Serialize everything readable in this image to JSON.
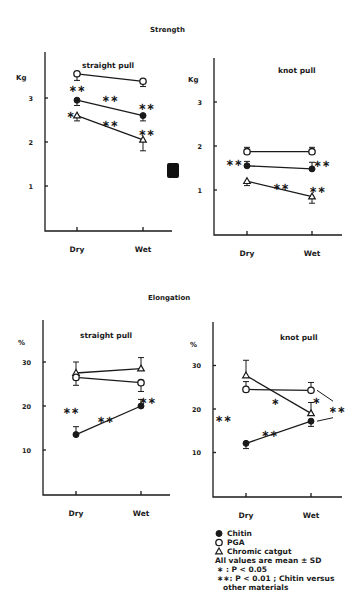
{
  "figure": {
    "section_titles": {
      "strength": "Strength",
      "elongation": "Elongation"
    },
    "legend": {
      "items": [
        {
          "marker": "filled-circle",
          "label": "Chitin"
        },
        {
          "marker": "open-circle",
          "label": "PGA"
        },
        {
          "marker": "open-triangle",
          "label": "Chromic catgut"
        }
      ],
      "notes": [
        "All values are mean ± SD",
        "∗ : P < 0.05",
        "∗∗: P < 0.01 ; Chitin versus",
        "other materials"
      ]
    },
    "artifact": {
      "type": "black-square",
      "color": "#111111"
    }
  },
  "chart_data": [
    {
      "type": "line",
      "title": "straight pull",
      "section": "Strength",
      "xlabel": "",
      "ylabel": "Kg",
      "categories": [
        "Dry",
        "Wet"
      ],
      "yticks": [
        "1",
        "2",
        "3"
      ],
      "ylim": [
        0,
        4
      ],
      "grid": false,
      "series": [
        {
          "name": "PGA",
          "marker": "open-circle",
          "values": [
            3.55,
            3.38
          ],
          "sd": [
            0.15,
            0.12
          ],
          "sd_dir": [
            -1,
            -1
          ]
        },
        {
          "name": "Chitin",
          "marker": "filled-circle",
          "values": [
            2.95,
            2.6
          ],
          "sd": [
            0.12,
            0.12
          ],
          "sd_dir": [
            -1,
            -1
          ]
        },
        {
          "name": "Chromic catgut",
          "marker": "open-triangle",
          "values": [
            2.6,
            2.05
          ],
          "sd": [
            0.12,
            0.25
          ],
          "sd_dir": [
            -1,
            -1
          ]
        }
      ],
      "annotations": [
        {
          "text": "∗∗",
          "x": 0.0,
          "y": 3.2
        },
        {
          "text": "∗∗",
          "x": 0.5,
          "y": 2.98
        },
        {
          "text": "∗∗",
          "x": 1.05,
          "y": 2.8
        },
        {
          "text": "∗",
          "x": -0.1,
          "y": 2.62
        },
        {
          "text": "∗∗",
          "x": 0.5,
          "y": 2.4
        },
        {
          "text": "∗∗",
          "x": 1.05,
          "y": 2.2
        }
      ]
    },
    {
      "type": "line",
      "title": "knot pull",
      "section": "Strength",
      "xlabel": "",
      "ylabel": "Kg",
      "categories": [
        "Dry",
        "Wet"
      ],
      "yticks": [
        "1",
        "2",
        "3"
      ],
      "ylim": [
        0,
        4
      ],
      "grid": false,
      "series": [
        {
          "name": "PGA",
          "marker": "open-circle",
          "values": [
            1.87,
            1.87
          ],
          "sd": [
            0.1,
            0.1
          ],
          "sd_dir": [
            1,
            1
          ]
        },
        {
          "name": "Chitin",
          "marker": "filled-circle",
          "values": [
            1.55,
            1.48
          ],
          "sd": [
            0.1,
            0.15
          ],
          "sd_dir": [
            1,
            1
          ]
        },
        {
          "name": "Chromic catgut",
          "marker": "open-triangle",
          "values": [
            1.2,
            0.85
          ],
          "sd": [
            0.1,
            0.15
          ],
          "sd_dir": [
            -1,
            -1
          ]
        }
      ],
      "annotations": [
        {
          "text": "∗∗",
          "x": -0.2,
          "y": 1.62
        },
        {
          "text": "∗∗",
          "x": 1.15,
          "y": 1.58
        },
        {
          "text": "∗∗",
          "x": 0.52,
          "y": 1.06
        },
        {
          "text": "∗∗",
          "x": 1.08,
          "y": 1.0
        }
      ]
    },
    {
      "type": "line",
      "title": "straight pull",
      "section": "Elongation",
      "xlabel": "",
      "ylabel": "%",
      "categories": [
        "Dry",
        "Wet"
      ],
      "yticks": [
        "10",
        "20",
        "30"
      ],
      "ylim": [
        0,
        40
      ],
      "grid": false,
      "series": [
        {
          "name": "Chromic catgut",
          "marker": "open-triangle",
          "values": [
            27.5,
            28.5
          ],
          "sd": [
            2.5,
            2.5
          ],
          "sd_dir": [
            1,
            1
          ]
        },
        {
          "name": "PGA",
          "marker": "open-circle",
          "values": [
            26.5,
            25.3
          ],
          "sd": [
            1.8,
            2.0
          ],
          "sd_dir": [
            -1,
            -1
          ]
        },
        {
          "name": "Chitin",
          "marker": "filled-circle",
          "values": [
            13.5,
            20.0
          ],
          "sd": [
            1.8,
            1.5
          ],
          "sd_dir": [
            1,
            1
          ]
        }
      ],
      "annotations": [
        {
          "text": "∗∗",
          "x": -0.08,
          "y": 18.8
        },
        {
          "text": "∗∗",
          "x": 0.45,
          "y": 16.8
        },
        {
          "text": "∗∗",
          "x": 1.1,
          "y": 21.2
        }
      ]
    },
    {
      "type": "line",
      "title": "knot pull",
      "section": "Elongation",
      "xlabel": "",
      "ylabel": "%",
      "categories": [
        "Dry",
        "Wet"
      ],
      "yticks": [
        "10",
        "20",
        "30"
      ],
      "ylim": [
        0,
        40
      ],
      "grid": false,
      "series": [
        {
          "name": "Chromic catgut",
          "marker": "open-triangle",
          "values": [
            27.7,
            19.0
          ],
          "sd": [
            3.5,
            2.5
          ],
          "sd_dir": [
            1,
            1
          ]
        },
        {
          "name": "PGA",
          "marker": "open-circle",
          "values": [
            24.5,
            24.3
          ],
          "sd": [
            1.8,
            1.8
          ],
          "sd_dir": [
            1,
            1
          ]
        },
        {
          "name": "Chitin",
          "marker": "filled-circle",
          "values": [
            12.1,
            17.2
          ],
          "sd": [
            1.2,
            1.2
          ],
          "sd_dir": [
            -1,
            -1
          ]
        }
      ],
      "annotations": [
        {
          "text": "∗∗",
          "x": -0.35,
          "y": 17.7
        },
        {
          "text": "∗∗",
          "x": 0.36,
          "y": 14.3
        },
        {
          "text": "∗",
          "x": 0.45,
          "y": 21.6
        },
        {
          "text": "∗",
          "x": 1.08,
          "y": 21.8
        },
        {
          "text": "∗∗",
          "x": 1.4,
          "y": 19.8
        }
      ],
      "brackets": [
        {
          "from_series": "PGA",
          "to": [
            1.4,
            21.8
          ]
        },
        {
          "from_series": "Chitin",
          "to": [
            1.4,
            18.0
          ]
        }
      ]
    }
  ]
}
